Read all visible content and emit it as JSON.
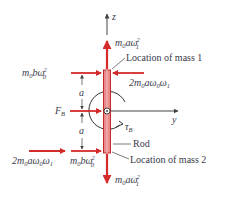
{
  "diagram": {
    "axes": {
      "z_label": "z",
      "y_label": "y",
      "origin_symbol": "dot-in-circle (x-axis out of page)"
    },
    "colors": {
      "force_arrow": "#d42a2a",
      "rod_fill": "#e98a8a",
      "rod_stroke": "#c62828",
      "axis": "#444444",
      "text": "#3a3a4a"
    },
    "forces": {
      "top_vertical": {
        "m": "m",
        "m_sub": "0",
        "body": "aω",
        "w_sub": "1",
        "sup": "2",
        "full": "m₀aω₁²"
      },
      "top_left_horizontal": {
        "full": "m₀bω₀²",
        "m": "m",
        "m_sub": "0",
        "body": "bω",
        "w_sub": "0",
        "sup": "2"
      },
      "top_right_horizontal": {
        "full": "2m₀aω₀ω₁",
        "prefix": "2m",
        "m_sub": "0",
        "body1": "aω",
        "w1_sub": "0",
        "body2": "ω",
        "w2_sub": "1"
      },
      "F_B": {
        "main": "F",
        "sub": "B"
      },
      "bottom_left_horizontal_far": {
        "full": "2m₀aω₀ω₁",
        "prefix": "2m",
        "m_sub": "0",
        "body1": "aω",
        "w1_sub": "0",
        "body2": "ω",
        "w2_sub": "1"
      },
      "bottom_left_horizontal_near": {
        "full": "m₀bω₀²",
        "m": "m",
        "m_sub": "0",
        "body": "bω",
        "w_sub": "0",
        "sup": "2"
      },
      "bottom_vertical": {
        "full": "m₀aω₁²",
        "m": "m",
        "m_sub": "0",
        "body": "aω",
        "w_sub": "1",
        "sup": "2"
      }
    },
    "torque": {
      "main": "τ",
      "sub": "B"
    },
    "dimensions": {
      "upper": "a",
      "lower": "a"
    },
    "callouts": {
      "mass1": "Location of mass 1",
      "mass2": "Location of mass 2",
      "rod": "Rod"
    }
  }
}
